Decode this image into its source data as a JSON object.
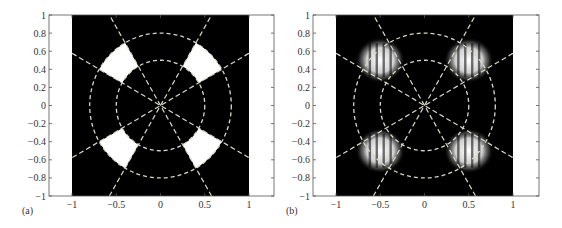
{
  "chart_data": [
    {
      "type": "heatmap",
      "panel_label": "(a)",
      "title": "",
      "xlabel": "",
      "ylabel": "",
      "xlim": [
        -1.25,
        1.25
      ],
      "ylim": [
        -1,
        1
      ],
      "xticks": [
        -1,
        -0.5,
        0,
        0.5,
        1
      ],
      "xtick_labels": [
        "−1",
        "−0.5",
        "0",
        "0.5",
        "1"
      ],
      "yticks": [
        1,
        0.8,
        0.6,
        0.4,
        0.2,
        0,
        -0.2,
        -0.4,
        -0.6,
        -0.8,
        -1
      ],
      "ytick_labels": [
        "1",
        "0.8",
        "0.6",
        "0.4",
        "0.2",
        "0",
        "−0.2",
        "−0.4",
        "−0.6",
        "−0.8",
        "−1"
      ],
      "image_extent": [
        -1,
        1,
        -1,
        1
      ],
      "description": "Binary mask: white annular sectors on black background",
      "sectors": [
        {
          "r_inner": 0.5,
          "r_outer": 0.8,
          "theta_start_deg": 30,
          "theta_end_deg": 60
        },
        {
          "r_inner": 0.5,
          "r_outer": 0.8,
          "theta_start_deg": 120,
          "theta_end_deg": 150
        },
        {
          "r_inner": 0.5,
          "r_outer": 0.8,
          "theta_start_deg": 210,
          "theta_end_deg": 240
        },
        {
          "r_inner": 0.5,
          "r_outer": 0.8,
          "theta_start_deg": 300,
          "theta_end_deg": 330
        }
      ],
      "overlay_circles_r": [
        0.5,
        0.8
      ],
      "overlay_radial_angles_deg": [
        30,
        60,
        120,
        150
      ]
    },
    {
      "type": "heatmap",
      "panel_label": "(b)",
      "title": "",
      "xlabel": "",
      "ylabel": "",
      "xlim": [
        -1.25,
        1.25
      ],
      "ylim": [
        -1,
        1
      ],
      "xticks": [
        -1,
        -0.5,
        0,
        0.5,
        1
      ],
      "xtick_labels": [
        "−1",
        "−0.5",
        "0",
        "0.5",
        "1"
      ],
      "yticks": [
        1,
        0.8,
        0.6,
        0.4,
        0.2,
        0,
        -0.2,
        -0.4,
        -0.6,
        -0.8,
        -1
      ],
      "ytick_labels": [
        "1",
        "0.8",
        "0.6",
        "0.4",
        "0.2",
        "0",
        "−0.2",
        "−0.4",
        "−0.6",
        "−0.8",
        "−1"
      ],
      "image_extent": [
        -1,
        1,
        -1,
        1
      ],
      "description": "Intensity map: four bright lobes with vertical fringe stripes centered near (±0.5, ±0.5)",
      "lobes": [
        {
          "cx": -0.5,
          "cy": 0.5,
          "rx": 0.28,
          "ry": 0.25,
          "stripes": 5
        },
        {
          "cx": 0.5,
          "cy": 0.5,
          "rx": 0.28,
          "ry": 0.25,
          "stripes": 5
        },
        {
          "cx": -0.5,
          "cy": -0.5,
          "rx": 0.28,
          "ry": 0.25,
          "stripes": 5
        },
        {
          "cx": 0.5,
          "cy": -0.5,
          "rx": 0.28,
          "ry": 0.25,
          "stripes": 5
        }
      ],
      "overlay_circles_r": [
        0.5,
        0.8
      ],
      "overlay_radial_angles_deg": [
        30,
        60,
        120,
        150
      ]
    }
  ],
  "panels": {
    "a": {
      "label": "(a)"
    },
    "b": {
      "label": "(b)"
    }
  },
  "colors": {
    "background": "#000000",
    "mask": "#ffffff",
    "overlay": "#d8d8c8",
    "axis": "#555555"
  }
}
